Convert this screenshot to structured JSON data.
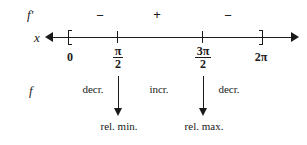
{
  "diagram": {
    "kind": "first-derivative-sign-chart",
    "ink_color": "#1a1a1a",
    "background_color": "#ffffff"
  },
  "rows": {
    "derivative_label": "f′",
    "axis_label": "x",
    "function_label": "f"
  },
  "sign_row": {
    "signs": [
      {
        "symbol": "−",
        "interval": "0 to π/2"
      },
      {
        "symbol": "+",
        "interval": "π/2 to 3π/2"
      },
      {
        "symbol": "−",
        "interval": "3π/2 to 2π"
      }
    ]
  },
  "axis": {
    "left_arrow": "left-arrowhead",
    "right_arrow": "right-arrowhead",
    "ticks": [
      {
        "label": "0",
        "numerator": "",
        "denominator": "",
        "is_fraction": false,
        "mark": "bracket-left"
      },
      {
        "label": "π/2",
        "numerator": "π",
        "denominator": "2",
        "is_fraction": true,
        "mark": "tick"
      },
      {
        "label": "3π/2",
        "numerator": "3π",
        "denominator": "2",
        "is_fraction": true,
        "mark": "tick"
      },
      {
        "label": "2π",
        "numerator": "",
        "denominator": "",
        "is_fraction": false,
        "mark": "bracket-right"
      }
    ]
  },
  "behaviour_row": {
    "items": [
      {
        "text": "decr.",
        "interval": "0 to π/2"
      },
      {
        "text": "incr.",
        "interval": "π/2 to 3π/2"
      },
      {
        "text": "decr.",
        "interval": "3π/2 to 2π"
      }
    ]
  },
  "extrema": [
    {
      "caption": "rel. min.",
      "at": "π/2"
    },
    {
      "caption": "rel. max.",
      "at": "3π/2"
    }
  ]
}
